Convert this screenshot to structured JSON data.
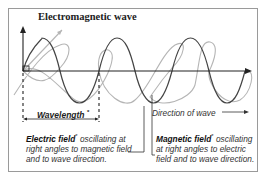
{
  "title": "Electromagnetic wave",
  "labels": {
    "wavelength": "Wavelength",
    "wavelength_marker": "*",
    "direction": "Direction of wave",
    "electric_field_term": "Electric field",
    "electric_field_marker": "*",
    "electric_field_desc": " oscillating at right angles to magnetic field and to wave direction.",
    "magnetic_field_term": "Magnetic field",
    "magnetic_field_marker": "*",
    "magnetic_field_desc": " oscillating at right angles to electric field and to wave direction."
  },
  "colors": {
    "electric_wave": "#444444",
    "magnetic_wave": "#b5b5b5",
    "axis": "#222222",
    "frame": "#9a9a9a"
  }
}
